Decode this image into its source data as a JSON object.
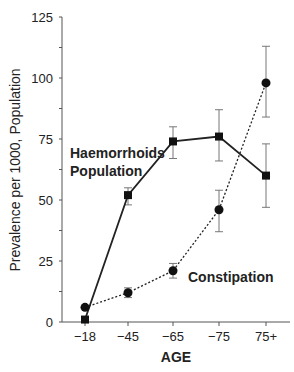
{
  "chart_data": {
    "type": "line",
    "title": "",
    "xlabel": "AGE",
    "ylabel": "Prevalence per 1000, Population",
    "categories": [
      "-18",
      "-45",
      "-65",
      "-75",
      "75+"
    ],
    "ylim": [
      0,
      125
    ],
    "yticks": [
      0,
      25,
      50,
      75,
      100,
      125
    ],
    "grid": false,
    "series": [
      {
        "name": "Haemorrhoids Population",
        "label_lines": [
          "Haemorrhoids",
          "Population"
        ],
        "style": "solid",
        "marker": "square",
        "values": [
          1,
          52,
          74,
          76,
          60
        ],
        "error_low": [
          null,
          48,
          67,
          66,
          47
        ],
        "error_high": [
          null,
          55,
          80,
          87,
          73
        ]
      },
      {
        "name": "Constipation",
        "label_lines": [
          "Constipation"
        ],
        "style": "dotted",
        "marker": "circle",
        "values": [
          6,
          12,
          21,
          46,
          98
        ],
        "error_low": [
          null,
          10,
          18,
          37,
          84
        ],
        "error_high": [
          null,
          14,
          24,
          54,
          113
        ]
      }
    ]
  }
}
